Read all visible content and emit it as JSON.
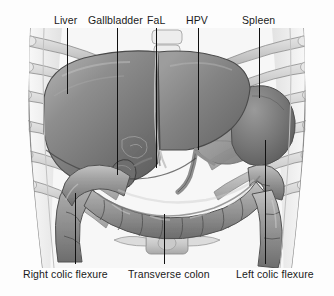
{
  "figure": {
    "style": "grayscale medical illustration",
    "width": 334,
    "height": 296,
    "background_color": "#fdfdfd",
    "line_color": "#111111",
    "text_color": "#1a1a1a"
  },
  "labels": {
    "top": [
      {
        "id": "liver",
        "text": "Liver",
        "label_x": 54,
        "leader_x": 67,
        "leader_top": 28,
        "leader_bottom": 94
      },
      {
        "id": "gallbladder",
        "text": "Gallbladder",
        "label_x": 88,
        "leader_x": 117,
        "leader_top": 28,
        "leader_bottom": 175
      },
      {
        "id": "fal",
        "text": "FaL",
        "label_x": 147,
        "leader_x": 156,
        "leader_top": 28,
        "leader_bottom": 168
      },
      {
        "id": "hpv",
        "text": "HPV",
        "label_x": 186,
        "leader_x": 198,
        "leader_top": 28,
        "leader_bottom": 150
      },
      {
        "id": "spleen",
        "text": "Spleen",
        "label_x": 242,
        "leader_x": 259,
        "leader_top": 28,
        "leader_bottom": 98
      }
    ],
    "bottom": [
      {
        "id": "right-colic-flexure",
        "text": "Right colic flexure",
        "label_x": 23,
        "leader_x": 75,
        "leader_top": 193,
        "leader_bottom": 264
      },
      {
        "id": "transverse-colon",
        "text": "Transverse colon",
        "label_x": 128,
        "leader_x": 164,
        "leader_top": 214,
        "leader_bottom": 264
      },
      {
        "id": "left-colic-flexure",
        "text": "Left colic flexure",
        "label_x": 236,
        "leader_x": 265,
        "leader_top": 140,
        "leader_bottom": 264
      }
    ]
  },
  "structures": {
    "liver": {
      "name": "Liver",
      "tone": "#8d8d8d"
    },
    "gallbladder": {
      "name": "Gallbladder",
      "tone": "#6f6f6f"
    },
    "falciform_ligament": {
      "name": "FaL",
      "tone": "#b9b9b9"
    },
    "hepatic_portal_vein": {
      "name": "HPV",
      "tone": "#9a9a9a"
    },
    "spleen": {
      "name": "Spleen",
      "tone": "#7b7b7b"
    },
    "colon": {
      "name": "Colon",
      "tone": "#9e9e9e"
    },
    "ribs": {
      "name": "Rib cage",
      "tone": "#c9c9c9"
    },
    "costal_cartilage": {
      "name": "Costal cartilage",
      "tone": "#dadada"
    },
    "vertebra": {
      "name": "Lumbar vertebra",
      "tone": "#d2d2d2"
    },
    "body_wall": {
      "name": "Abdominal wall",
      "tone": "#f0f0f0"
    }
  }
}
